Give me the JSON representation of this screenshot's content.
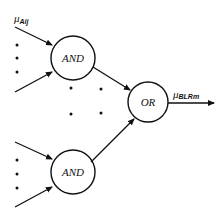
{
  "diagram": {
    "type": "fuzzy-logic-rule-network",
    "input_label": {
      "symbol": "μ",
      "subscript": "Aij"
    },
    "output_label": {
      "symbol": "μ",
      "subscript": "BLRm"
    },
    "gates": {
      "and_top": {
        "label": "AND",
        "cx": 73,
        "cy": 58,
        "r": 22
      },
      "and_bottom": {
        "label": "AND",
        "cx": 73,
        "cy": 172,
        "r": 22
      },
      "or": {
        "label": "OR",
        "cx": 148,
        "cy": 102,
        "r": 20
      }
    },
    "ellipsis_note": "vertical dots between inputs and 2x2 dots between AND gates indicate repeated elements",
    "colors": {
      "stroke": "#111111",
      "background": "#ffffff"
    }
  }
}
